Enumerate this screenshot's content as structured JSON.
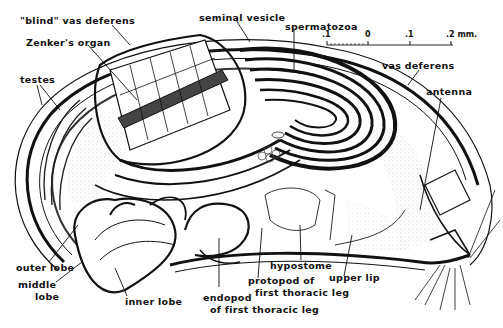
{
  "figure": {
    "labels": {
      "blind_vas_deferens": "\"blind\" vas deferens",
      "zenkers_organ": "Zenker's organ",
      "testes": "testes",
      "seminal_vesicle": "seminal vesicle",
      "spermatozoa": "spermatozoa",
      "vas_deferens": "vas deferens",
      "antenna": "antenna",
      "outer_lobe": "outer lobe",
      "middle_lobe_1": "middle",
      "middle_lobe_2": "lobe",
      "inner_lobe": "inner lobe",
      "endopod_1": "endopod",
      "endopod_2": "of first thoracic leg",
      "protopod_1": "protopod of",
      "protopod_2": "first thoracic leg",
      "hypostome": "hypostome",
      "upper_lip": "upper lip"
    },
    "scale_bar": {
      "ticks": [
        ".1",
        "0",
        ".1",
        ".2 mm."
      ],
      "unit": "mm"
    }
  },
  "colors": {
    "ink": "#111111",
    "background": "#ffffff",
    "stipple": "#bbbbbb"
  }
}
